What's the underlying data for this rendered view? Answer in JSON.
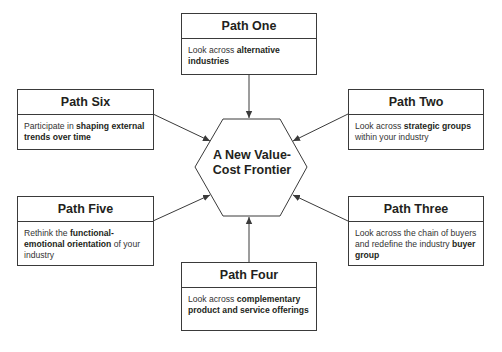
{
  "center": {
    "label_line1": "A New Value-",
    "label_line2": "Cost Frontier"
  },
  "paths": [
    {
      "id": "one",
      "title": "Path One",
      "parts": [
        {
          "t": "Look across ",
          "b": false
        },
        {
          "t": "alternative industries",
          "b": true
        }
      ]
    },
    {
      "id": "two",
      "title": "Path Two",
      "parts": [
        {
          "t": "Look across ",
          "b": false
        },
        {
          "t": "strategic groups",
          "b": true
        },
        {
          "t": " within your industry",
          "b": false
        }
      ]
    },
    {
      "id": "three",
      "title": "Path Three",
      "parts": [
        {
          "t": "Look across the chain of buyers and redefine the industry ",
          "b": false
        },
        {
          "t": "buyer group",
          "b": true
        }
      ]
    },
    {
      "id": "four",
      "title": "Path Four",
      "parts": [
        {
          "t": "Look across ",
          "b": false
        },
        {
          "t": "complementary product and service offerings",
          "b": true
        }
      ]
    },
    {
      "id": "five",
      "title": "Path Five",
      "parts": [
        {
          "t": "Rethink the ",
          "b": false
        },
        {
          "t": "functional-emotional orientation",
          "b": true
        },
        {
          "t": " of your industry",
          "b": false
        }
      ]
    },
    {
      "id": "six",
      "title": "Path Six",
      "parts": [
        {
          "t": "Participate in ",
          "b": false
        },
        {
          "t": "shaping external trends over time",
          "b": true
        }
      ]
    }
  ],
  "colors": {
    "line": "#3a3a3a",
    "text": "#231f20"
  }
}
